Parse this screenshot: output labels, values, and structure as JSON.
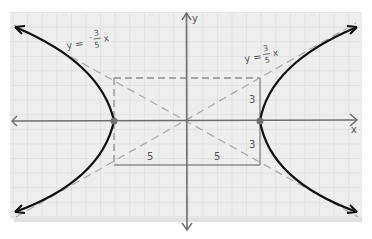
{
  "diagram": {
    "title": "",
    "type": "hyperbola graph on grid paper",
    "equation_hint": "x^2/25 - y^2/9 = 1",
    "axes": {
      "x_label": "x",
      "y_label": "y"
    },
    "asymptotes": [
      {
        "label_lhs": "y =",
        "label_num": "3",
        "label_den": "5",
        "label_var": "x",
        "sign": "-",
        "display": "y = -3/5 x"
      },
      {
        "label_lhs": "y =",
        "label_num": "3",
        "label_den": "5",
        "label_var": "x",
        "sign": "+",
        "display": "y = 3/5 x"
      }
    ],
    "box_labels": {
      "left_width": "5",
      "right_width": "5",
      "upper_height": "3",
      "lower_height": "3"
    },
    "vertices": [
      {
        "x": -5,
        "y": 0
      },
      {
        "x": 5,
        "y": 0
      }
    ],
    "colors": {
      "paper": "#ececec",
      "grid": "#d4d4d4",
      "axis": "#6e6e6e",
      "curve": "#111111",
      "dashed": "#9a9a9a",
      "vertex": "#707070",
      "box": "#8a8a8a"
    }
  }
}
